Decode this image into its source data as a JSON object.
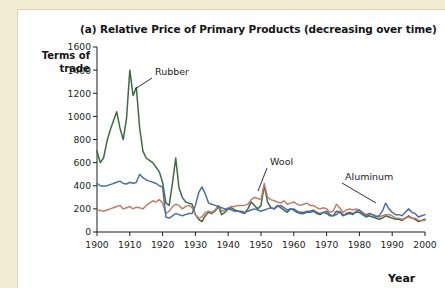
{
  "figure": {
    "title": "(a) Relative Price of Primary Products (decreasing over time)",
    "y_axis_title_line1": "Terms of",
    "y_axis_title_line2": "trade",
    "x_axis_title": "Year"
  },
  "colors": {
    "rubber": "#3d6b42",
    "wool": "#c07d6c",
    "aluminum": "#4d6fa5",
    "axis": "#1b1b1b",
    "panel_background": "#ffffff",
    "page_background": "#f4ecd3"
  },
  "annotations": [
    {
      "label": "Rubber",
      "series": "Rubber"
    },
    {
      "label": "Wool",
      "series": "Wool"
    },
    {
      "label": "Aluminum",
      "series": "Aluminum"
    }
  ],
  "chart_data": {
    "type": "line",
    "title": "(a) Relative Price of Primary Products (decreasing over time)",
    "xlabel": "Year",
    "ylabel": "Terms of trade",
    "xlim": [
      1900,
      2000
    ],
    "ylim": [
      0,
      1600
    ],
    "xticks": [
      1900,
      1910,
      1920,
      1930,
      1940,
      1950,
      1960,
      1970,
      1980,
      1990,
      2000
    ],
    "yticks": [
      0,
      200,
      400,
      600,
      800,
      1000,
      1200,
      1400,
      1600
    ],
    "grid": false,
    "legend": "inline-annotations",
    "x": [
      1900,
      1901,
      1902,
      1903,
      1904,
      1905,
      1906,
      1907,
      1908,
      1909,
      1910,
      1911,
      1912,
      1913,
      1914,
      1915,
      1916,
      1917,
      1918,
      1919,
      1920,
      1921,
      1922,
      1923,
      1924,
      1925,
      1926,
      1927,
      1928,
      1929,
      1930,
      1931,
      1932,
      1933,
      1934,
      1935,
      1936,
      1937,
      1938,
      1939,
      1940,
      1941,
      1942,
      1943,
      1944,
      1945,
      1946,
      1947,
      1948,
      1949,
      1950,
      1951,
      1952,
      1953,
      1954,
      1955,
      1956,
      1957,
      1958,
      1959,
      1960,
      1961,
      1962,
      1963,
      1964,
      1965,
      1966,
      1967,
      1968,
      1969,
      1970,
      1971,
      1972,
      1973,
      1974,
      1975,
      1976,
      1977,
      1978,
      1979,
      1980,
      1981,
      1982,
      1983,
      1984,
      1985,
      1986,
      1987,
      1988,
      1989,
      1990,
      1991,
      1992,
      1993,
      1994,
      1995,
      1996,
      1997,
      1998,
      1999,
      2000
    ],
    "series": [
      {
        "name": "Rubber",
        "color": "#3d6b42",
        "values": [
          700,
          600,
          640,
          780,
          880,
          960,
          1040,
          900,
          800,
          980,
          1400,
          1180,
          1250,
          900,
          700,
          640,
          620,
          600,
          560,
          520,
          430,
          250,
          230,
          420,
          640,
          380,
          300,
          260,
          250,
          240,
          150,
          110,
          90,
          140,
          170,
          160,
          180,
          220,
          150,
          170,
          200,
          210,
          190,
          180,
          170,
          160,
          200,
          260,
          230,
          200,
          230,
          400,
          260,
          210,
          200,
          230,
          210,
          190,
          170,
          200,
          190,
          170,
          160,
          160,
          170,
          170,
          180,
          160,
          150,
          170,
          160,
          140,
          140,
          180,
          170,
          140,
          160,
          170,
          160,
          170,
          170,
          150,
          130,
          140,
          130,
          120,
          110,
          120,
          140,
          130,
          120,
          110,
          110,
          100,
          120,
          140,
          120,
          110,
          90,
          100,
          110
        ]
      },
      {
        "name": "Wool",
        "color": "#c07d6c",
        "values": [
          190,
          185,
          180,
          190,
          200,
          210,
          220,
          230,
          200,
          210,
          220,
          200,
          215,
          210,
          200,
          230,
          250,
          270,
          260,
          280,
          250,
          160,
          180,
          220,
          240,
          230,
          200,
          220,
          230,
          210,
          150,
          120,
          130,
          170,
          180,
          170,
          190,
          230,
          180,
          190,
          210,
          220,
          220,
          230,
          230,
          230,
          240,
          280,
          300,
          290,
          280,
          420,
          300,
          280,
          270,
          260,
          250,
          270,
          240,
          250,
          260,
          240,
          230,
          240,
          250,
          230,
          230,
          210,
          200,
          210,
          200,
          170,
          180,
          240,
          210,
          170,
          190,
          200,
          190,
          200,
          190,
          170,
          150,
          160,
          150,
          140,
          130,
          140,
          150,
          150,
          140,
          120,
          120,
          110,
          120,
          130,
          120,
          120,
          100,
          100,
          100
        ]
      },
      {
        "name": "Aluminum",
        "color": "#4d6fa5",
        "values": [
          420,
          400,
          395,
          400,
          410,
          420,
          430,
          440,
          420,
          415,
          430,
          420,
          430,
          500,
          470,
          450,
          440,
          430,
          420,
          400,
          390,
          130,
          120,
          140,
          160,
          150,
          140,
          150,
          160,
          160,
          230,
          340,
          390,
          330,
          250,
          240,
          230,
          220,
          210,
          200,
          200,
          190,
          180,
          180,
          180,
          170,
          180,
          190,
          200,
          190,
          180,
          190,
          200,
          210,
          200,
          220,
          230,
          210,
          190,
          200,
          200,
          180,
          170,
          170,
          180,
          180,
          190,
          170,
          160,
          170,
          180,
          150,
          140,
          150,
          180,
          150,
          150,
          160,
          150,
          180,
          190,
          160,
          140,
          160,
          150,
          130,
          140,
          180,
          250,
          200,
          170,
          150,
          150,
          140,
          170,
          200,
          170,
          160,
          130,
          140,
          150
        ]
      }
    ]
  }
}
